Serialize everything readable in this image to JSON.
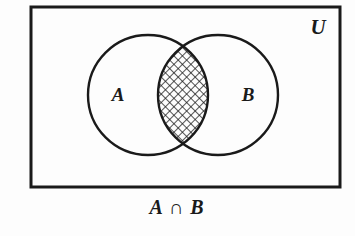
{
  "figure": {
    "kind": "venn-diagram",
    "caption": "A ∩ B",
    "universe_label": "U",
    "background_color": "#fdfdfd",
    "stroke_color": "#1a1a1a"
  },
  "universe_rect": {
    "name": "universal-set-rectangle",
    "x": 31,
    "y": 7,
    "width": 309,
    "height": 180,
    "stroke_width": 3
  },
  "sets": [
    {
      "id": "A",
      "label": "A",
      "cx": 148,
      "cy": 95,
      "r": 60,
      "label_x": 118,
      "label_y": 101,
      "shaded": false
    },
    {
      "id": "B",
      "label": "B",
      "cx": 218,
      "cy": 95,
      "r": 60,
      "label_x": 248,
      "label_y": 101,
      "shaded": false
    }
  ],
  "region": {
    "name": "intersection",
    "label": "A ∩ B",
    "fill": "crosshatch",
    "hatch_spacing": 6,
    "hatch_angle_degrees": 45,
    "description": "lens-shaped overlap of circle A and circle B, cross-hatched"
  },
  "labels": {
    "universe": {
      "text": "U",
      "x": 318,
      "y": 34
    },
    "caption": {
      "text": "A ∩ B",
      "x": 177,
      "y": 214
    }
  }
}
